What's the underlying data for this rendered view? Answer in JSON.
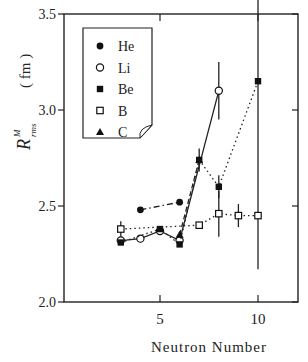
{
  "chart_data": {
    "type": "scatter",
    "title": "",
    "xlabel": "Neutron Number",
    "ylabel": "R rms M (fm)",
    "ylabel_main": "R",
    "ylabel_sub": "rms",
    "ylabel_sup": "M",
    "ylabel_unit": "( fm )",
    "xlim": [
      0,
      12
    ],
    "ylim": [
      2.0,
      3.5
    ],
    "xticks": [
      5,
      10
    ],
    "xtick_labels": [
      "5",
      "10"
    ],
    "yticks": [
      2.0,
      2.5,
      3.0,
      3.5
    ],
    "ytick_labels": [
      "2.0",
      "2.5",
      "3.0",
      "3.5"
    ],
    "grid": false,
    "legend_position": "upper-left",
    "series": [
      {
        "name": "He",
        "marker": "filled-circle",
        "line": "dash-dot",
        "points": [
          {
            "x": 4,
            "y": 2.48
          },
          {
            "x": 6,
            "y": 2.52
          }
        ]
      },
      {
        "name": "Li",
        "marker": "open-circle",
        "line": "solid",
        "points": [
          {
            "x": 3,
            "y": 2.32
          },
          {
            "x": 4,
            "y": 2.33
          },
          {
            "x": 5,
            "y": 2.37
          },
          {
            "x": 6,
            "y": 2.32
          },
          {
            "x": 8,
            "y": 3.1,
            "err": 0.15
          }
        ]
      },
      {
        "name": "Be",
        "marker": "filled-square",
        "line": "dotted",
        "points": [
          {
            "x": 3,
            "y": 2.31
          },
          {
            "x": 5,
            "y": 2.38
          },
          {
            "x": 6,
            "y": 2.3
          },
          {
            "x": 7,
            "y": 2.74,
            "err": 0.06
          },
          {
            "x": 8,
            "y": 2.6,
            "err": 0.06
          },
          {
            "x": 10,
            "y": 3.15,
            "err": 0.98
          }
        ]
      },
      {
        "name": "B",
        "marker": "open-square",
        "line": "dotted",
        "points": [
          {
            "x": 3,
            "y": 2.38,
            "err": 0.04
          },
          {
            "x": 7,
            "y": 2.4
          },
          {
            "x": 8,
            "y": 2.46,
            "err": 0.12
          },
          {
            "x": 9,
            "y": 2.45,
            "err": 0.06
          },
          {
            "x": 10,
            "y": 2.45
          }
        ]
      },
      {
        "name": "C",
        "marker": "filled-triangle",
        "line": "dashed",
        "points": [
          {
            "x": 6,
            "y": 2.35
          },
          {
            "x": 7,
            "y": 2.74
          }
        ]
      }
    ]
  }
}
